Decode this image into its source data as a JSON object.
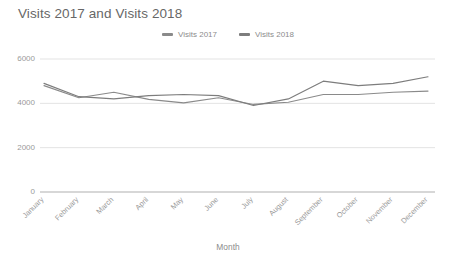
{
  "chart_data": {
    "type": "line",
    "title": "Visits 2017 and Visits 2018",
    "xlabel": "Month",
    "ylabel": "",
    "ylim": [
      0,
      6000
    ],
    "yticks": [
      0,
      2000,
      4000,
      6000
    ],
    "ytick_labels": [
      "0",
      "2000",
      "4000",
      "6000"
    ],
    "grid": true,
    "legend_position": "top-center",
    "categories": [
      "January",
      "February",
      "March",
      "April",
      "May",
      "June",
      "July",
      "August",
      "September",
      "October",
      "November",
      "December"
    ],
    "series": [
      {
        "name": "Visits 2017",
        "color": "#8a8a8a",
        "values": [
          4800,
          4250,
          4500,
          4180,
          4020,
          4250,
          3950,
          4050,
          4400,
          4400,
          4500,
          4550
        ]
      },
      {
        "name": "Visits 2018",
        "color": "#7d7d7d",
        "values": [
          4900,
          4300,
          4200,
          4350,
          4400,
          4350,
          3900,
          4200,
          5000,
          4800,
          4900,
          5200
        ]
      }
    ]
  },
  "axis": {
    "x_title": "Month"
  },
  "colors": {
    "title": "#676767",
    "tick": "#9a9a9a",
    "grid": "#e3e3e3",
    "axis": "#b0b0b0",
    "legend_text": "#8c8c8c"
  }
}
